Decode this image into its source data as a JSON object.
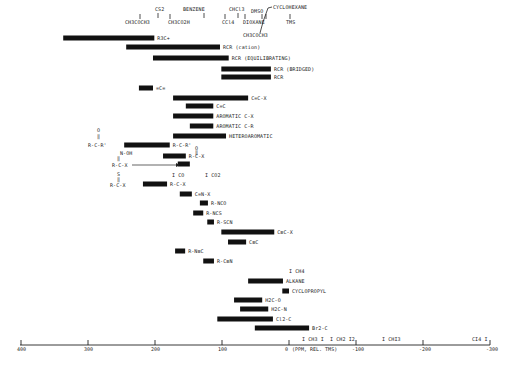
{
  "chart_data": {
    "type": "bar",
    "orientation": "horizontal-range",
    "title": "",
    "xlabel": "(PPM, REL. TMS)",
    "ylabel": "",
    "xlim": [
      400,
      -300
    ],
    "x_ticks": [
      400,
      300,
      200,
      100,
      0,
      -100,
      -200,
      -300
    ],
    "x_tick_labels": [
      "400",
      "300",
      "200",
      "100",
      "0",
      "-100",
      "-200",
      "-300"
    ],
    "grid": false,
    "legend": null,
    "reference_markers_top": [
      {
        "label": "CH3COCH3",
        "ppm": 206,
        "sub": "*"
      },
      {
        "label": "CS2",
        "ppm": 193
      },
      {
        "label": "CH3CO2H",
        "ppm": 178,
        "sub": "*"
      },
      {
        "label": "BENZENE",
        "ppm": 128
      },
      {
        "label": "CCl4",
        "ppm": 96
      },
      {
        "label": "CHCl3",
        "ppm": 77
      },
      {
        "label": "DIOXANE",
        "ppm": 67
      },
      {
        "label": "DMSO",
        "ppm": 40
      },
      {
        "label": "CH3COCH3",
        "ppm": 30,
        "sub": "*"
      },
      {
        "label": "CYCLOHEXANE",
        "ppm": 27
      },
      {
        "label": "TMS",
        "ppm": 0
      }
    ],
    "reference_markers_inline": [
      {
        "label": "CO",
        "ppm": 184
      },
      {
        "label": "CO2",
        "ppm": 125
      },
      {
        "label": "CH4",
        "ppm": -2
      },
      {
        "label": "CH3I",
        "ppm": -21
      },
      {
        "label": "CH2I2",
        "ppm": -54
      },
      {
        "label": "CHI3",
        "ppm": -140
      },
      {
        "label": "CI4",
        "ppm": -292
      }
    ],
    "series": [
      {
        "name": "R3C+",
        "start": 337,
        "end": 201
      },
      {
        "name": "R-C(X)-R (carbocation)",
        "start": 243,
        "end": 103
      },
      {
        "name": "RCR (EQUILIBRATING)",
        "start": 203,
        "end": 90
      },
      {
        "name": "RCR (BRIDGED)",
        "start": 101,
        "end": 27
      },
      {
        "name": "RCR",
        "start": 101,
        "end": 27
      },
      {
        "name": "=C=",
        "start": 224,
        "end": 203
      },
      {
        "name": "C=C-X",
        "start": 173,
        "end": 61
      },
      {
        "name": "C=C",
        "start": 154,
        "end": 113
      },
      {
        "name": "AROMATIC C-X",
        "start": 173,
        "end": 113
      },
      {
        "name": "AROMATIC C-R",
        "start": 148,
        "end": 113
      },
      {
        "name": "HETEROAROMATIC",
        "start": 173,
        "end": 94
      },
      {
        "name": "R-C(=O)-R'",
        "start": 246,
        "end": 178
      },
      {
        "name": "R-C(=O)-X / C=N-OH",
        "start": 188,
        "end": 154
      },
      {
        "name": "R-C(=O)-X (arrow)",
        "start": 166,
        "end": 148
      },
      {
        "name": "R-C(=S)-X",
        "start": 218,
        "end": 182
      },
      {
        "name": "C=N-X",
        "start": 163,
        "end": 145
      },
      {
        "name": "R-NCO",
        "start": 133,
        "end": 121
      },
      {
        "name": "R-NCS",
        "start": 143,
        "end": 128
      },
      {
        "name": "R-SCN",
        "start": 122,
        "end": 112
      },
      {
        "name": "C≡C-X",
        "start": 101,
        "end": 22
      },
      {
        "name": "C≡C",
        "start": 91,
        "end": 64
      },
      {
        "name": "R-N≡C",
        "start": 170,
        "end": 155
      },
      {
        "name": "R-C≡N",
        "start": 128,
        "end": 112
      },
      {
        "name": "ALKANE",
        "start": 61,
        "end": 9
      },
      {
        "name": "CYCLOPROPYL",
        "start": 10,
        "end": 0
      },
      {
        "name": "H2C-O",
        "start": 82,
        "end": 40
      },
      {
        "name": "H2C-N",
        "start": 73,
        "end": 31
      },
      {
        "name": "Cl2-C",
        "start": 107,
        "end": 24
      },
      {
        "name": "Br2-C",
        "start": 51,
        "end": -30
      }
    ]
  },
  "labels": {
    "top": {
      "acetone1": "CH3COCH3",
      "cs2": "CS2",
      "acoh": "CH3CO2H",
      "benzene": "BENZENE",
      "ccl4": "CCl4",
      "chcl3": "CHCl3",
      "dioxane": "DIOXANE",
      "dmso": "DMSO",
      "acetone2": "CH3COCH3",
      "cyclohexane": "CYCLOHEXANE",
      "tms": "TMS"
    },
    "bars": [
      "R3C+",
      "RCR (cation)",
      "RCR (EQUILIBRATING)",
      "RCR (BRIDGED)",
      "RCR",
      "=C=",
      "C=C-X",
      "C=C",
      "AROMATIC C-X",
      "AROMATIC C-R",
      "HETEROAROMATIC",
      "R-C-R'",
      "R-C-X",
      "",
      "R-C-X",
      "C=N-X",
      "R-NCO",
      "R-NCS",
      "R-SCN",
      "C≡C-X",
      "C≡C",
      "R-N≡C",
      "R-C≡N",
      "ALKANE",
      "CYCLOPROPYL",
      "H2C-O",
      "H2C-N",
      "Cl2-C",
      "Br2-C"
    ],
    "left": {
      "ketone": "R-C-R'",
      "oxime": "N-OH",
      "acyl": "R-C-X",
      "thio": "R-C-X"
    },
    "inline": {
      "co": "I CO",
      "co2": "I CO2",
      "ch4": "I CH4",
      "ch3i": "I CH3 I",
      "ch2i2": "I CH2 I2",
      "chi3": "I CHI3",
      "ci4": "CI4 I"
    },
    "axis_title": "(PPM, REL. TMS)"
  }
}
